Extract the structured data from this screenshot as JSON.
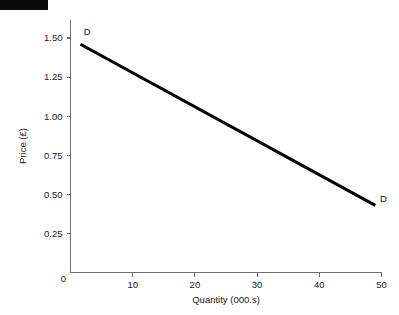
{
  "figure": {
    "background_color": "#ffffff",
    "redaction_bar": {
      "label": "redacted-header-bar",
      "color": "#0a0a0a"
    }
  },
  "chart_data": {
    "type": "line",
    "title": "",
    "xlabel": "Quantity (000.s)",
    "ylabel": "Price (£)",
    "xlim": [
      0,
      50
    ],
    "ylim": [
      0,
      1.5
    ],
    "grid": false,
    "legend": "none",
    "x_ticks": [
      0,
      10,
      20,
      30,
      40,
      50
    ],
    "x_tick_labels": [
      "0",
      "10",
      "20",
      "30",
      "40",
      "50"
    ],
    "y_ticks": [
      0.25,
      0.5,
      0.75,
      1.0,
      1.25,
      1.5
    ],
    "y_tick_labels": [
      "0.25",
      "0.50",
      "0.75",
      "1.00",
      "1.25",
      "1.50"
    ],
    "series": [
      {
        "name": "D",
        "color": "#000000",
        "linewidth": 3,
        "x": [
          1.6,
          49.0
        ],
        "y": [
          1.46,
          0.43
        ]
      }
    ],
    "annotations": [
      {
        "text": "D",
        "x": 2.7,
        "y": 1.54,
        "name": "demand-label-top"
      },
      {
        "text": "D",
        "x": 50.3,
        "y": 0.47,
        "name": "demand-label-bottom"
      }
    ]
  }
}
